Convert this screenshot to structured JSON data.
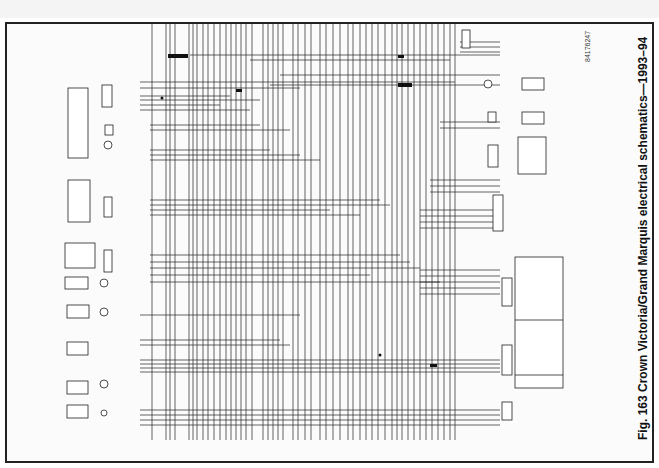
{
  "figure": {
    "caption": "Fig. 163 Crown Victoria/Grand Marquis electrical schematics—1993–94",
    "code": "84176247"
  },
  "diagram": {
    "type": "electrical wiring schematic",
    "orientation": "rotated 90 degrees",
    "left_components": [
      {
        "name": "headlamp-switch",
        "y": 78
      },
      {
        "name": "autolamp-sensor",
        "y": 195
      },
      {
        "name": "autolamp-switch",
        "y": 255
      },
      {
        "name": "courtesy-lamp",
        "y": 315
      },
      {
        "name": "lamp",
        "y": 365
      },
      {
        "name": "door-switch",
        "y": 400
      },
      {
        "name": "lamp-2",
        "y": 465
      },
      {
        "name": "lamp-3",
        "y": 410
      }
    ],
    "right_components": [
      {
        "name": "module-connector-top",
        "y": 45
      },
      {
        "name": "lamp-right",
        "y": 83
      },
      {
        "name": "motor",
        "y": 118
      },
      {
        "name": "power-antenna-switch",
        "y": 160
      },
      {
        "name": "connector-c2",
        "y": 210
      },
      {
        "name": "connector-c3",
        "y": 305
      },
      {
        "name": "connector-c4",
        "y": 400
      }
    ],
    "legend_box": {
      "present": true
    }
  }
}
